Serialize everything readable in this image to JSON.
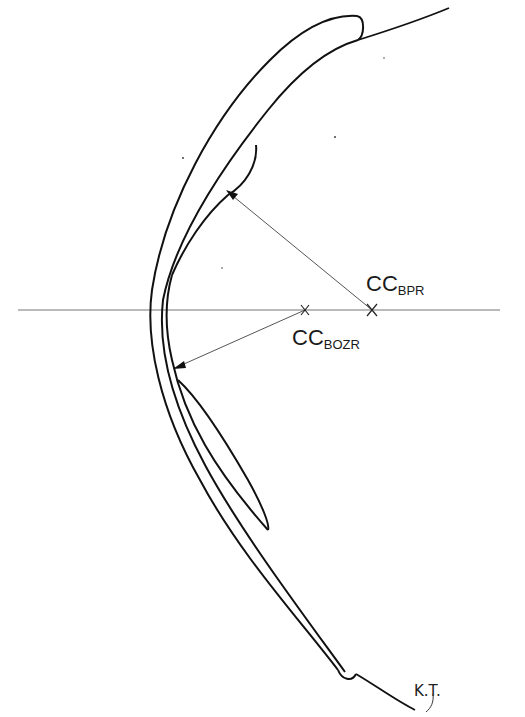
{
  "diagram": {
    "title": "",
    "kind": "contact lens cross-section (back optic zone vs back peripheral radius)",
    "colors": {
      "background": "#ffffff",
      "stroke": "#111111",
      "axis": "#777777",
      "radius_line": "#555555"
    },
    "labels": {
      "bpr": {
        "main": "CC",
        "sub": "BPR"
      },
      "bozr": {
        "main": "CC",
        "sub": "BOZR"
      },
      "signature": "K.T."
    },
    "centres": {
      "bpr": {
        "x": 372,
        "y": 310
      },
      "bozr": {
        "x": 305,
        "y": 310
      }
    },
    "axis": {
      "x1": 18,
      "x2": 500,
      "y": 310
    }
  }
}
